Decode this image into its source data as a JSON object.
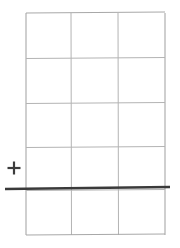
{
  "canvas": {
    "width": 180,
    "height": 248,
    "background": "#ffffff"
  },
  "figure": {
    "title": "",
    "grid": {
      "name": "grid-table",
      "columns": 3,
      "rows": 5,
      "x_left": 26,
      "x_right": 165,
      "y_top": 13,
      "y_bottom": 235,
      "line_color": "#b4b4b4",
      "line_color_outer": "#a8a8a8",
      "line_width": 1,
      "vertical_lines": [
        26,
        71,
        118,
        165
      ],
      "horizontal_lines": [
        13,
        58,
        103,
        147,
        190,
        235
      ]
    },
    "rule": {
      "name": "horizontal-rule",
      "x_start": 5,
      "x_end": 170,
      "y_start": 189,
      "y_end": 187,
      "color": "#3a3a3a",
      "line_width": 2.6
    },
    "plus_mark": {
      "name": "plus-mark",
      "symbol": "+",
      "center_x": 14,
      "center_y": 168,
      "size": 13,
      "color": "#3c3c3c",
      "stroke_width": 2.2
    }
  }
}
